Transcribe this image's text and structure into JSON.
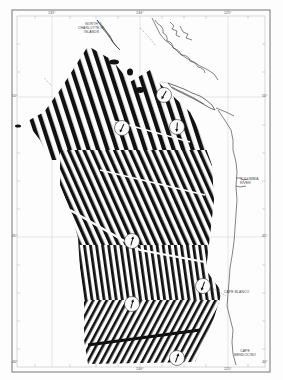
{
  "figure": {
    "type": "magnetic anomaly map",
    "region": "Northeast Pacific, off British Columbia, Washington, Oregon and northern California"
  },
  "graticule": {
    "longitudes": [
      {
        "label": "135°",
        "x": 52
      },
      {
        "label": "130°",
        "x": 140
      },
      {
        "label": "125°",
        "x": 228
      }
    ],
    "latitudes": [
      {
        "label": "50°",
        "y": 97
      },
      {
        "label": "45°",
        "y": 237
      },
      {
        "label": "40°",
        "y": 362
      }
    ],
    "bottom_labels": [
      "130°",
      "125°"
    ]
  },
  "labels": {
    "queen_charlotte": "NORTH\nCHARLOTTE IS.\nISLANDS",
    "columbia": "COLUMBIA\nRIVER",
    "cape_blanco": "CAPE BLANCO",
    "cape_mendocino": "CAPE\nMENDOCINO"
  },
  "arrows": [
    {
      "x": 164,
      "y": 95,
      "angle": 210
    },
    {
      "x": 122,
      "y": 128,
      "angle": 205
    },
    {
      "x": 177,
      "y": 127,
      "angle": 185
    },
    {
      "x": 132,
      "y": 241,
      "angle": 15
    },
    {
      "x": 203,
      "y": 286,
      "angle": 200
    },
    {
      "x": 132,
      "y": 304,
      "angle": 15
    },
    {
      "x": 177,
      "y": 358,
      "angle": 20
    }
  ],
  "colors": {
    "ink": "#111111",
    "paper": "#fdfdfd",
    "grid": "#c8c8c8",
    "frame": "#888888"
  }
}
